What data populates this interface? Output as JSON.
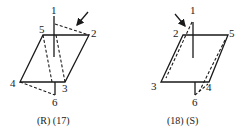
{
  "figures": [
    {
      "id": "R17",
      "caption": "(R) (17)",
      "vertex_labels": {
        "v1": "1",
        "v2": "2",
        "v3": "3",
        "v4": "4",
        "v5": "5",
        "v6": "6"
      },
      "arrow": "viewing-direction-arrow"
    },
    {
      "id": "18S",
      "caption": "(18) (S)",
      "vertex_labels": {
        "v1": "1",
        "v2": "2",
        "v3": "3",
        "v4": "4",
        "v5": "5",
        "v6": "6"
      },
      "arrow": "viewing-direction-arrow"
    }
  ],
  "colors": {
    "ink": "#1a1a1a",
    "background": "#ffffff"
  }
}
